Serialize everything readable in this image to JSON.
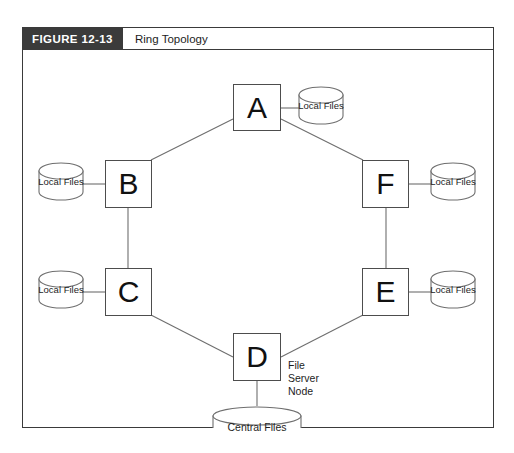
{
  "figure": {
    "tag": "FIGURE 12-13",
    "title": "Ring Topology"
  },
  "diagram": {
    "type": "network-topology",
    "topology": "ring",
    "nodes": [
      {
        "id": "A",
        "label": "A",
        "store": "Local Files",
        "store_side": "right"
      },
      {
        "id": "B",
        "label": "B",
        "store": "Local Files",
        "store_side": "left"
      },
      {
        "id": "C",
        "label": "C",
        "store": "Local Files",
        "store_side": "left"
      },
      {
        "id": "D",
        "label": "D",
        "store": "Central Files",
        "store_side": "bottom",
        "annotation": "File Server Node"
      },
      {
        "id": "E",
        "label": "E",
        "store": "Local Files",
        "store_side": "right"
      },
      {
        "id": "F",
        "label": "F",
        "store": "Local Files",
        "store_side": "right"
      }
    ],
    "links": [
      {
        "from": "A",
        "to": "B"
      },
      {
        "from": "B",
        "to": "C"
      },
      {
        "from": "C",
        "to": "D"
      },
      {
        "from": "D",
        "to": "E"
      },
      {
        "from": "E",
        "to": "F"
      },
      {
        "from": "F",
        "to": "A"
      }
    ],
    "annotation": {
      "line1": "File",
      "line2": "Server",
      "line3": "Node"
    },
    "stores": {
      "local": "Local Files",
      "central": "Central Files"
    },
    "colors": {
      "frame": "#3a3a3a",
      "tag_background": "#3b3b3b",
      "tag_text": "#ffffff",
      "node_border": "#4d4d4d",
      "line": "#6e6e6e",
      "text": "#1d1d1d",
      "background": "#ffffff"
    }
  }
}
